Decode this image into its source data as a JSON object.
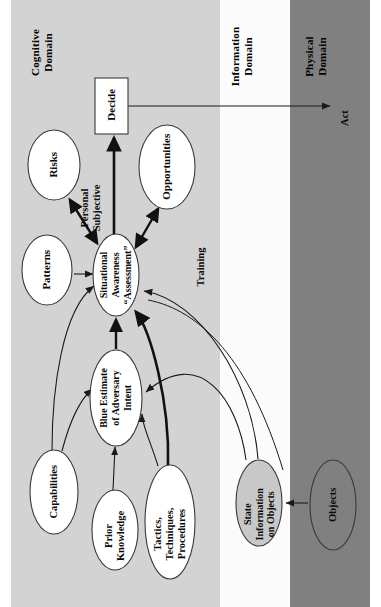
{
  "figure": {
    "orientation": "rotated-90-ccw",
    "colors": {
      "cognitive_panel": "#d3d3d3",
      "information_panel": "#fbfbfb",
      "physical_panel": "#808080",
      "node_fill_white": "#ffffff",
      "node_fill_gray": "#c8c8c8",
      "stroke": "#1a1a1a",
      "page_background": "#ffffff"
    }
  },
  "domains": [
    {
      "id": "cognitive",
      "label": "Cognitive\nDomain"
    },
    {
      "id": "information",
      "label": "Information\nDomain"
    },
    {
      "id": "physical",
      "label": "Physical\nDomain"
    }
  ],
  "nodes": [
    {
      "id": "decide",
      "label": "Decide",
      "shape": "rect",
      "fill": "#ffffff",
      "domain": "cognitive"
    },
    {
      "id": "risks",
      "label": "Risks",
      "shape": "ellipse",
      "fill": "#ffffff",
      "domain": "cognitive"
    },
    {
      "id": "opportunities",
      "label": "Opportunities",
      "shape": "ellipse",
      "fill": "#ffffff",
      "domain": "cognitive"
    },
    {
      "id": "patterns",
      "label": "Patterns",
      "shape": "ellipse",
      "fill": "#ffffff",
      "domain": "cognitive"
    },
    {
      "id": "sa",
      "label": "Situational\nAwareness\n“Assessment”",
      "shape": "ellipse",
      "fill": "#ffffff",
      "domain": "cognitive"
    },
    {
      "id": "blue_estimate",
      "label": "Blue Estimate\nof Adversary\nIntent",
      "shape": "ellipse",
      "fill": "#ffffff",
      "domain": "cognitive"
    },
    {
      "id": "capabilities",
      "label": "Capabilities",
      "shape": "ellipse",
      "fill": "#ffffff",
      "domain": "cognitive"
    },
    {
      "id": "prior",
      "label": "Prior\nKnowledge",
      "shape": "ellipse",
      "fill": "#ffffff",
      "domain": "cognitive"
    },
    {
      "id": "ttp",
      "label": "Tactics,\nTechniques,\nProcedures",
      "shape": "ellipse",
      "fill": "#ffffff",
      "domain": "cognitive"
    },
    {
      "id": "state_info",
      "label": "State\nInformation\non Objects",
      "shape": "ellipse",
      "fill": "#c8c8c8",
      "domain": "information"
    },
    {
      "id": "objects",
      "label": "Objects",
      "shape": "ellipse",
      "fill": "#808080",
      "domain": "physical"
    }
  ],
  "edge_labels": [
    {
      "id": "personal_subjective",
      "label": "Personal\nSubjective"
    },
    {
      "id": "training",
      "label": "Training"
    },
    {
      "id": "act",
      "label": "Act"
    }
  ],
  "edges": [
    {
      "from": "sa",
      "to": "decide",
      "style": "thick",
      "arrow": "single"
    },
    {
      "from": "decide",
      "to": "act",
      "style": "thin",
      "arrow": "single"
    },
    {
      "from": "sa",
      "to": "risks",
      "style": "thick",
      "arrow": "double"
    },
    {
      "from": "sa",
      "to": "opportunities",
      "style": "thick",
      "arrow": "double"
    },
    {
      "from": "patterns",
      "to": "sa",
      "style": "thin",
      "arrow": "single"
    },
    {
      "from": "blue_estimate",
      "to": "sa",
      "style": "thick",
      "arrow": "single"
    },
    {
      "from": "capabilities",
      "to": "sa",
      "style": "thin",
      "arrow": "single"
    },
    {
      "from": "capabilities",
      "to": "blue_estimate",
      "style": "thin",
      "arrow": "single"
    },
    {
      "from": "prior",
      "to": "blue_estimate",
      "style": "thin",
      "arrow": "single"
    },
    {
      "from": "ttp",
      "to": "blue_estimate",
      "style": "thin",
      "arrow": "single"
    },
    {
      "from": "ttp",
      "to": "sa",
      "style": "thick",
      "arrow": "single"
    },
    {
      "from": "state_info",
      "to": "blue_estimate",
      "style": "thin",
      "arrow": "single"
    },
    {
      "from": "state_info",
      "to": "sa",
      "style": "thin",
      "arrow": "single"
    },
    {
      "from": "objects",
      "to": "state_info",
      "style": "thin",
      "arrow": "single"
    }
  ]
}
